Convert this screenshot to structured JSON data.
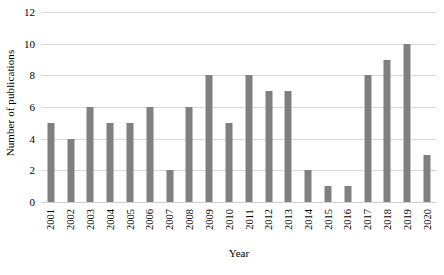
{
  "chart_data": {
    "type": "bar",
    "title": "",
    "xlabel": "Year",
    "ylabel": "Number of publications",
    "categories": [
      "2001",
      "2002",
      "2003",
      "2004",
      "2005",
      "2006",
      "2007",
      "2008",
      "2009",
      "2010",
      "2011",
      "2012",
      "2013",
      "2014",
      "2015",
      "2016",
      "2017",
      "2018",
      "2019",
      "2020"
    ],
    "values": [
      5,
      4,
      6,
      5,
      5,
      6,
      2,
      6,
      8,
      5,
      8,
      7,
      7,
      2,
      1,
      1,
      8,
      9,
      10,
      3
    ],
    "ylim": [
      0,
      12
    ],
    "yticks": [
      0,
      2,
      4,
      6,
      8,
      10,
      12
    ],
    "ytick_labels": [
      "0",
      "2",
      "4",
      "6",
      "8",
      "10",
      "12"
    ],
    "grid": "horizontal",
    "legend": "none",
    "bar_color": "#808080",
    "gridline_color": "#d9d9d9",
    "background_color": "#ffffff",
    "text_color": "#000000"
  }
}
